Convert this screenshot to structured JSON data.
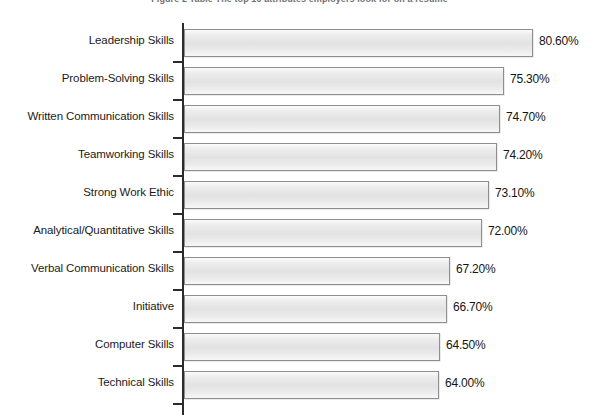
{
  "figure": {
    "title": "Figure 2  Table  The top 10 attributes employers look for on a resume",
    "title_visible_note": "clipped"
  },
  "chart_data": {
    "type": "bar",
    "orientation": "horizontal",
    "title": "Figure 2  Table  The top 10 attributes employers look for on a resume",
    "xlabel": "",
    "ylabel": "",
    "grid": false,
    "legend": null,
    "value_suffix": "%",
    "xlim": [
      58.4,
      82.6
    ],
    "categories": [
      "Leadership Skills",
      "Problem-Solving Skills",
      "Written Communication Skills",
      "Teamworking Skills",
      "Strong Work Ethic",
      "Analytical/Quantitative Skills",
      "Verbal Communication Skills",
      "Initiative",
      "Computer Skills",
      "Technical Skills"
    ],
    "values": [
      80.6,
      75.3,
      74.7,
      74.2,
      73.1,
      72.0,
      67.2,
      66.7,
      64.5,
      64.0
    ],
    "value_labels": [
      "80.60%",
      "75.30%",
      "74.70%",
      "74.20%",
      "73.10%",
      "72.00%",
      "67.20%",
      "66.70%",
      "64.50%",
      "64.00%"
    ],
    "bar_pixel_widths": [
      349,
      320,
      316,
      313,
      305,
      298,
      266,
      263,
      256,
      255
    ],
    "colors": {
      "bar_fill_light": "#fbfbfb",
      "bar_fill_mid": "#e2e2e2",
      "bar_border": "#8e8e8e",
      "axis": "#2b2b2b",
      "text": "#1b1b1b",
      "background": "#ffffff"
    }
  }
}
